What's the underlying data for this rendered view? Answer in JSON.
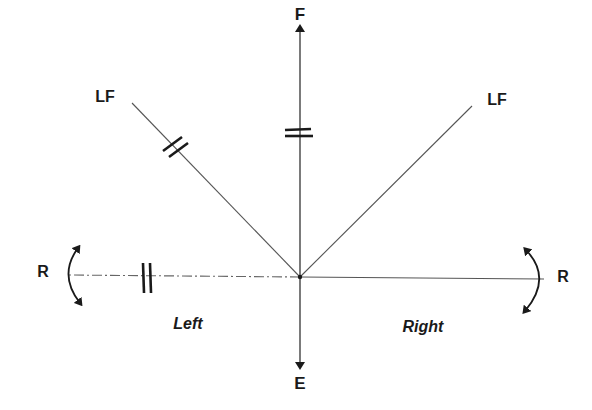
{
  "diagram": {
    "labels": {
      "forward": "F",
      "backward": "E",
      "left_forward_left": "LF",
      "left_forward_right": "LF",
      "rotation_left": "R",
      "rotation_right": "R",
      "side_left": "Left",
      "side_right": "Right"
    },
    "colors": {
      "line": "#555555",
      "ink": "#1a1a1a",
      "background": "#ffffff"
    },
    "origin": [
      300,
      277
    ]
  }
}
